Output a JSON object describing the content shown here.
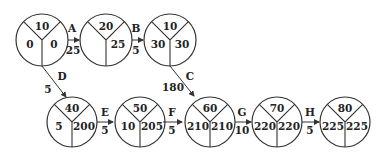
{
  "diagram": {
    "type": "activity-on-arrow network (node: event id / earliest / latest)",
    "nodes": [
      {
        "id": "10",
        "left": "0",
        "right": "0"
      },
      {
        "id": "20",
        "left": "",
        "right": "25"
      },
      {
        "id": "10",
        "left": "30",
        "right": "30"
      },
      {
        "id": "40",
        "left": "5",
        "right": "200"
      },
      {
        "id": "50",
        "left": "10",
        "right": "205"
      },
      {
        "id": "60",
        "left": "210",
        "right": "210"
      },
      {
        "id": "70",
        "left": "220",
        "right": "220"
      },
      {
        "id": "80",
        "left": "225",
        "right": "225"
      }
    ],
    "edges": [
      {
        "activity": "A",
        "duration": "25",
        "from": 0,
        "to": 1
      },
      {
        "activity": "B",
        "duration": "5",
        "from": 1,
        "to": 2
      },
      {
        "activity": "C",
        "duration": "180",
        "from": 2,
        "to": 5
      },
      {
        "activity": "D",
        "duration": "5",
        "from": 0,
        "to": 3
      },
      {
        "activity": "E",
        "duration": "5",
        "from": 3,
        "to": 4
      },
      {
        "activity": "F",
        "duration": "5",
        "from": 4,
        "to": 5
      },
      {
        "activity": "G",
        "duration": "10",
        "from": 5,
        "to": 6
      },
      {
        "activity": "H",
        "duration": "5",
        "from": 6,
        "to": 7
      }
    ]
  }
}
